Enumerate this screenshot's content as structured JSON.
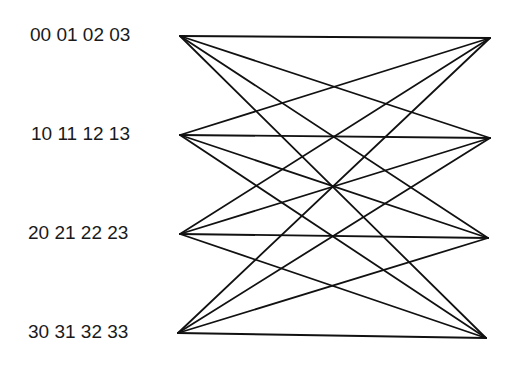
{
  "diagram": {
    "type": "complete-bipartite-graph",
    "left_nodes": [
      {
        "id": "L0",
        "label": "00 01 02 03",
        "x": 180,
        "y": 36
      },
      {
        "id": "L1",
        "label": "10 11 12 13",
        "x": 180,
        "y": 135
      },
      {
        "id": "L2",
        "label": "20 21 22 23",
        "x": 180,
        "y": 234
      },
      {
        "id": "L3",
        "label": "30 31 32 33",
        "x": 178,
        "y": 333
      }
    ],
    "right_nodes": [
      {
        "id": "R0",
        "x": 490,
        "y": 38
      },
      {
        "id": "R1",
        "x": 490,
        "y": 138
      },
      {
        "id": "R2",
        "x": 488,
        "y": 238
      },
      {
        "id": "R3",
        "x": 486,
        "y": 338
      }
    ],
    "edges": "every left node connected to every right node (16 edges)",
    "line_color": "#111111"
  }
}
